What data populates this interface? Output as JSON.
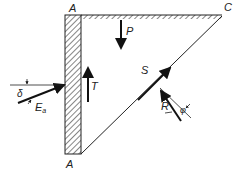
{
  "diagram": {
    "points": {
      "top_left": "A",
      "bottom_left": "A",
      "top_right": "C"
    },
    "forces": {
      "weight": "P",
      "wall_friction": "T",
      "slip_plane_force": "S",
      "reaction": "R",
      "active_thrust": "E",
      "active_thrust_sub": "a"
    },
    "angles": {
      "wall_friction_angle": "δ",
      "internal_friction_angle": "φ"
    },
    "colors": {
      "line": "#222222",
      "background": "#ffffff"
    }
  }
}
